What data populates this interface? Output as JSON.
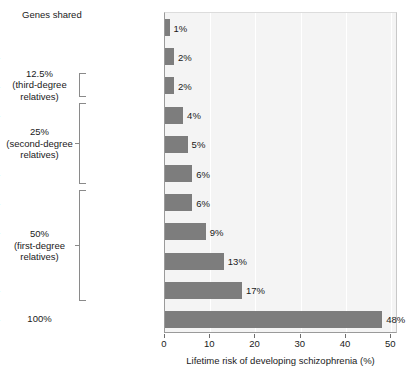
{
  "chart_data": {
    "type": "bar",
    "orientation": "horizontal",
    "title": "",
    "xlabel": "Lifetime risk of developing schizophrenia (%)",
    "ylabel": "",
    "xlim": [
      0,
      51.5
    ],
    "xticks": [
      0,
      10,
      20,
      30,
      40,
      50
    ],
    "xtick_labels": [
      "0",
      "10",
      "20",
      "30",
      "40",
      "50"
    ],
    "grid": "vertical-white",
    "legend": "none",
    "bar_color": "#7d7d7d",
    "plot_background": "#f4f4f4",
    "categories": [
      "General population",
      "First cousins",
      "Uncles/aunts",
      "Nephews/nieces",
      "Grandchildren",
      "Half-siblings",
      "Parents",
      "Siblings",
      "Children",
      "Fraternal twins",
      "Identical twins"
    ],
    "values": [
      1,
      2,
      2,
      4,
      5,
      6,
      6,
      9,
      13,
      17,
      48
    ],
    "value_labels": [
      "1%",
      "2%",
      "2%",
      "4%",
      "5%",
      "6%",
      "6%",
      "9%",
      "13%",
      "17%",
      "48%"
    ]
  },
  "annotations": {
    "header": "Genes shared",
    "groups": [
      {
        "id": "third-degree",
        "lines": [
          "12.5%",
          "(third-degree",
          "relatives)"
        ],
        "members": [
          "Uncles/aunts"
        ]
      },
      {
        "id": "second-degree",
        "lines": [
          "25%",
          "(second-degree",
          "relatives)"
        ],
        "members": [
          "Nephews/nieces",
          "Grandchildren",
          "Half-siblings"
        ]
      },
      {
        "id": "first-degree",
        "lines": [
          "50%",
          "(first-degree",
          "relatives)"
        ],
        "members": [
          "Parents",
          "Siblings",
          "Children",
          "Fraternal twins"
        ]
      },
      {
        "id": "identical",
        "lines": [
          "100%"
        ],
        "members": [
          "Identical twins"
        ]
      }
    ]
  }
}
